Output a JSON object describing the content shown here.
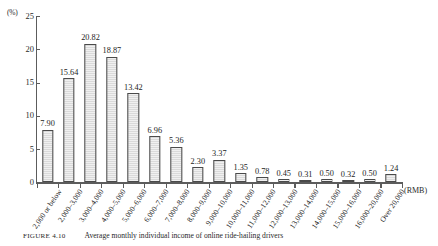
{
  "caption": {
    "label": "FIGURE 4.10",
    "text": "Average monthly individual income of online ride-hailing drivers"
  },
  "axes": {
    "y_unit": "(%)",
    "x_unit": "(RMB)",
    "y_ticks": [
      "0",
      "5",
      "10",
      "15",
      "20",
      "25"
    ]
  },
  "chart_data": {
    "type": "bar",
    "title": "Average monthly individual income of online ride-hailing drivers",
    "xlabel": "(RMB)",
    "ylabel": "(%)",
    "ylim": [
      0,
      25
    ],
    "yticks": [
      0,
      5,
      10,
      15,
      20,
      25
    ],
    "grid": false,
    "legend": "none",
    "bar_color": "#dedede",
    "bar_border_color": "#4a4a4a",
    "categories": [
      "2,000 or below",
      "2,000–3,000",
      "3,000–4,000",
      "4,000–5,000",
      "5,000–6,000",
      "6,000–7,000",
      "7,000–8,000",
      "8,000–9,000",
      "9,000–10,000",
      "10,000–11,000",
      "11,000–12,000",
      "12,000–13,000",
      "13,000–14,000",
      "14,000–15,000",
      "15,000–16,000",
      "16,000–20,000",
      "Over 20,000"
    ],
    "values": [
      7.9,
      15.64,
      20.82,
      18.87,
      13.42,
      6.96,
      5.36,
      2.3,
      3.37,
      1.35,
      0.78,
      0.45,
      0.31,
      0.5,
      0.32,
      0.5,
      1.24
    ],
    "value_labels": [
      "7.90",
      "15.64",
      "20.82",
      "18.87",
      "13.42",
      "6.96",
      "5.36",
      "2.30",
      "3.37",
      "1.35",
      "0.78",
      "0.45",
      "0.31",
      "0.50",
      "0.32",
      "0.50",
      "1.24"
    ]
  }
}
